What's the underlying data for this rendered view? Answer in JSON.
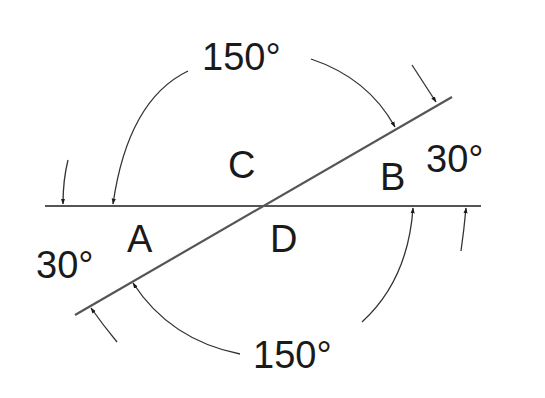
{
  "diagram": {
    "title": "",
    "lines": [
      {
        "id": "horizontal-line",
        "description": "horizontal straight line"
      },
      {
        "id": "transversal-line",
        "description": "slanted line intersecting horizontal at 30 degrees"
      }
    ],
    "points": {
      "A": "A",
      "B": "B",
      "C": "C",
      "D": "D"
    },
    "angles": {
      "top": "150°",
      "right": "30°",
      "left": "30°",
      "bottom": "150°"
    },
    "colors": {
      "line": "#555555",
      "text": "#1a1a1a",
      "background": "#ffffff"
    }
  }
}
